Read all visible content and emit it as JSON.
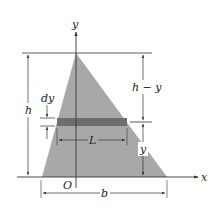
{
  "diagram": {
    "colors": {
      "triangle_fill": "#a8a8a8",
      "strip_fill": "#6e6e6e",
      "line": "#333333",
      "background": "#ffffff"
    },
    "axes": {
      "x_label": "x",
      "y_label": "y",
      "origin_label": "O"
    },
    "dimensions": {
      "height_label": "h",
      "top_segment_label": "h − y",
      "bottom_segment_label": "y",
      "strip_thickness_label": "dy",
      "strip_length_label": "L",
      "base_label": "b"
    }
  }
}
